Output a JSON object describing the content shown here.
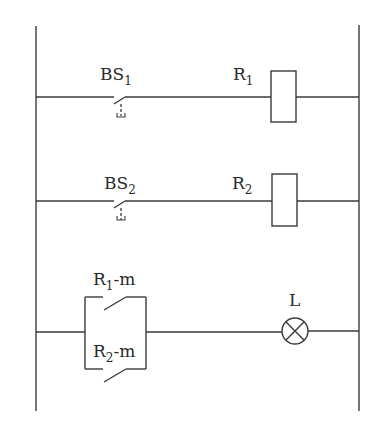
{
  "diagram": {
    "type": "ladder-logic",
    "colors": {
      "line": "#3a3a3a",
      "text": "#2a2a2a",
      "background": "#ffffff"
    },
    "rungs": [
      {
        "id": 1,
        "contact": {
          "label_main": "BS",
          "label_sub": "1",
          "kind": "push-button-normally-open"
        },
        "coil": {
          "label_main": "R",
          "label_sub": "1"
        }
      },
      {
        "id": 2,
        "contact": {
          "label_main": "BS",
          "label_sub": "2",
          "kind": "push-button-normally-open"
        },
        "coil": {
          "label_main": "R",
          "label_sub": "2"
        }
      },
      {
        "id": 3,
        "parallel_contacts": [
          {
            "label_main": "R",
            "label_sub": "1",
            "label_suffix": "-m",
            "kind": "normally-open"
          },
          {
            "label_main": "R",
            "label_sub": "2",
            "label_suffix": "-m",
            "kind": "normally-open"
          }
        ],
        "load": {
          "label": "L",
          "kind": "lamp"
        }
      }
    ]
  }
}
